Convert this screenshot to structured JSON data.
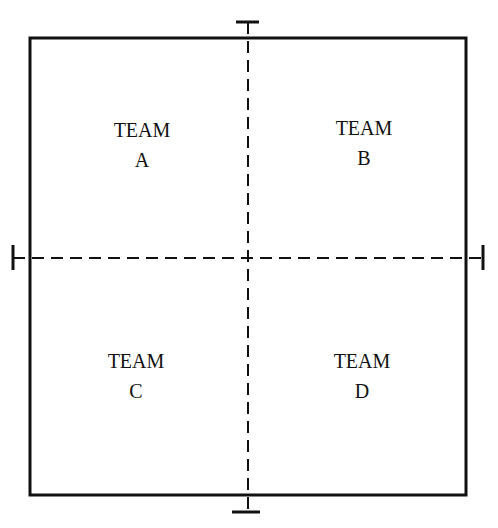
{
  "diagram": {
    "type": "field-quadrants",
    "stroke_color": "#111111",
    "background": "#ffffff",
    "quadrants": [
      {
        "team_word": "TEAM",
        "letter": "A"
      },
      {
        "team_word": "TEAM",
        "letter": "B"
      },
      {
        "team_word": "TEAM",
        "letter": "C"
      },
      {
        "team_word": "TEAM",
        "letter": "D"
      }
    ]
  }
}
